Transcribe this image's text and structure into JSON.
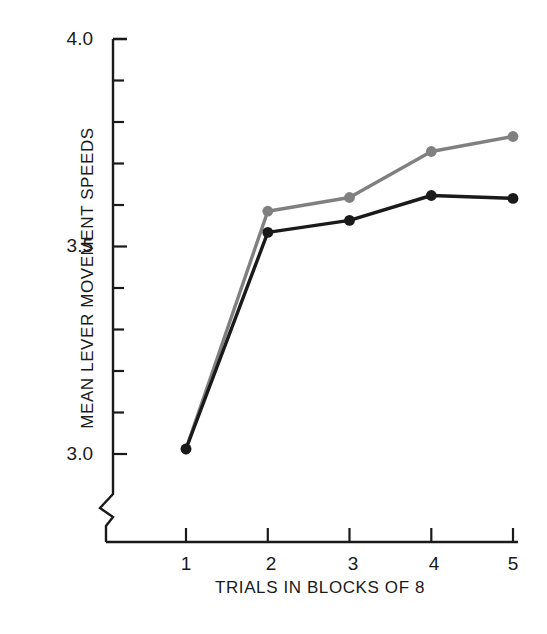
{
  "chart_data": {
    "type": "line",
    "title": "",
    "xlabel": "TRIALS IN BLOCKS OF 8",
    "ylabel": "MEAN LEVER MOVEMENT SPEEDS",
    "x": [
      1,
      2,
      3,
      4,
      5
    ],
    "xtick_labels": [
      "1",
      "2",
      "3",
      "4",
      "5"
    ],
    "ytick_labels": [
      "4.0",
      "3.5",
      "3.0"
    ],
    "ytick_values": [
      4.0,
      3.5,
      3.0
    ],
    "yminor_step": 0.1,
    "xlim": [
      0.55,
      5.45
    ],
    "ylim": [
      2.97,
      4.0
    ],
    "axis_break": true,
    "grid": false,
    "legend": "none",
    "series": [
      {
        "name": "gray-series",
        "color": "#808080",
        "marker": "circle",
        "values": [
          3.012,
          3.585,
          3.618,
          3.729,
          3.765
        ]
      },
      {
        "name": "black-series",
        "color": "#1a1a1a",
        "marker": "circle",
        "values": [
          3.012,
          3.534,
          3.563,
          3.623,
          3.616
        ]
      }
    ]
  },
  "axis": {
    "y_ticks": [
      {
        "label": "4.0"
      },
      {
        "label": "3.5"
      },
      {
        "label": "3.0"
      }
    ],
    "x_ticks": [
      {
        "label": "1"
      },
      {
        "label": "2"
      },
      {
        "label": "3"
      },
      {
        "label": "4"
      },
      {
        "label": "5"
      }
    ],
    "ylabel_text": "MEAN LEVER MOVEMENT SPEEDS",
    "xlabel_text": "TRIALS IN BLOCKS OF 8"
  },
  "colors": {
    "background": "#ffffff",
    "axis": "#1a1a1a",
    "series_gray": "#808080",
    "series_black": "#1a1a1a"
  }
}
